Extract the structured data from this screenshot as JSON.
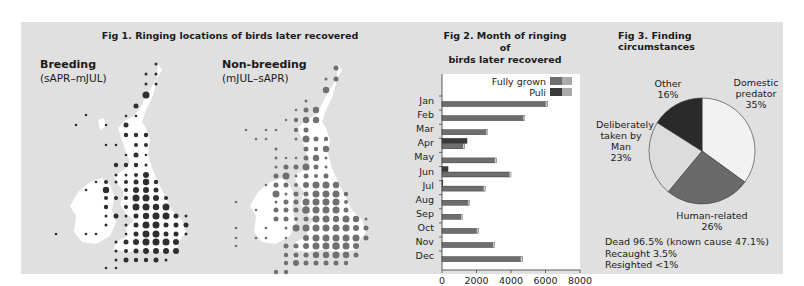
{
  "fig1": {
    "title": "Fig 1. Ringing locations of birds later recovered",
    "breeding": {
      "label": "Breeding",
      "period": "(sAPR–mJUL)",
      "dot_color": "#2e2e2e"
    },
    "nonbreeding": {
      "label": "Non-breeding",
      "period": "(mJUL–sAPR)",
      "dot_color": "#707070"
    }
  },
  "fig2": {
    "title_line1": "Fig 2. Month of ringing of",
    "title_line2": "birds later recovered",
    "legend": {
      "fully_grown": "Fully grown",
      "puli": "Puli"
    }
  },
  "fig3": {
    "title": "Fig 3. Finding circumstances",
    "labels": {
      "domestic_predator": {
        "name_line1": "Domestic",
        "name_line2": "predator",
        "pct": "35%"
      },
      "human_related": {
        "name": "Human-related",
        "pct": "26%"
      },
      "deliberately": {
        "name_line1": "Deliberately",
        "name_line2": "taken by",
        "name_line3": "Man",
        "pct": "23%"
      },
      "other": {
        "name": "Other",
        "pct": "16%"
      }
    },
    "footnotes": {
      "dead": "Dead 96.5% (known cause 47.1%)",
      "recaught": "Recaught 3.5%",
      "resighted": "Resighted <1%"
    }
  },
  "chart_data": [
    {
      "type": "bar",
      "orientation": "horizontal",
      "title": "Fig 2. Month of ringing of birds later recovered",
      "categories": [
        "Jan",
        "Feb",
        "Mar",
        "Apr",
        "May",
        "Jun",
        "Jul",
        "Aug",
        "Sep",
        "Oct",
        "Nov",
        "Dec"
      ],
      "series": [
        {
          "name": "Fully grown",
          "color": "#6e6e6e",
          "values": [
            6100,
            4800,
            2650,
            1300,
            3150,
            4000,
            2500,
            1600,
            1200,
            2100,
            3050,
            4650
          ]
        },
        {
          "name": "Puli",
          "color": "#3a3a3a",
          "values": [
            0,
            0,
            0,
            1450,
            0,
            350,
            50,
            0,
            0,
            0,
            0,
            0
          ]
        }
      ],
      "xlabel": "",
      "ylabel": "",
      "xticks": [
        0,
        2000,
        4000,
        6000,
        8000
      ],
      "xlim": [
        0,
        8000
      ],
      "legend_position": "top-right",
      "grid": false
    },
    {
      "type": "pie",
      "title": "Fig 3. Finding circumstances",
      "categories": [
        "Domestic predator",
        "Human-related",
        "Deliberately taken by Man",
        "Other"
      ],
      "values": [
        35,
        26,
        23,
        16
      ],
      "colors": [
        "#f2f2f2",
        "#6a6a6a",
        "#dcdcdc",
        "#2a2a2a"
      ],
      "annotations": [
        "Dead 96.5% (known cause 47.1%)",
        "Recaught 3.5%",
        "Resighted <1%"
      ]
    },
    {
      "type": "map",
      "title": "Fig 1. Ringing locations of birds later recovered",
      "panels": [
        "Breeding (sAPR–mJUL)",
        "Non-breeding (mJUL–sAPR)"
      ],
      "encoding": "proportional dots on grid over British Isles"
    }
  ]
}
